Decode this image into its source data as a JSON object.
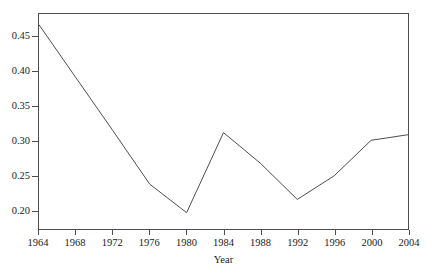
{
  "chart_data": {
    "type": "line",
    "title": "",
    "xlabel": "Year",
    "ylabel": "",
    "x": [
      1964,
      1968,
      1972,
      1976,
      1980,
      1984,
      1988,
      1992,
      1996,
      2000,
      2004
    ],
    "values": [
      0.467,
      0.391,
      0.315,
      0.238,
      0.197,
      0.312,
      0.268,
      0.216,
      0.25,
      0.301,
      0.309
    ],
    "series": [
      {
        "name": "value",
        "values": [
          0.467,
          0.391,
          0.315,
          0.238,
          0.197,
          0.312,
          0.268,
          0.216,
          0.25,
          0.301,
          0.309
        ]
      }
    ],
    "xlim": [
      1964,
      2004
    ],
    "ylim": [
      0.1735,
      0.4825
    ],
    "xticks": [
      1964,
      1968,
      1972,
      1976,
      1980,
      1984,
      1988,
      1992,
      1996,
      2000,
      2004
    ],
    "xtick_labels": [
      "1964",
      "1968",
      "1972",
      "1976",
      "1980",
      "1984",
      "1988",
      "1992",
      "1996",
      "2000",
      "2004"
    ],
    "yticks": [
      0.2,
      0.25,
      0.3,
      0.35,
      0.4,
      0.45
    ],
    "ytick_labels": [
      "0.20",
      "0.25",
      "0.30",
      "0.35",
      "0.40",
      "0.45"
    ],
    "grid": false,
    "legend": false,
    "line_color": "#4d4d4d",
    "background_color": "#ffffff",
    "frame": true,
    "vertices_note": "polyline with a single linear segment between 1964 and 1976"
  },
  "axes": {
    "x_title": "Year"
  }
}
